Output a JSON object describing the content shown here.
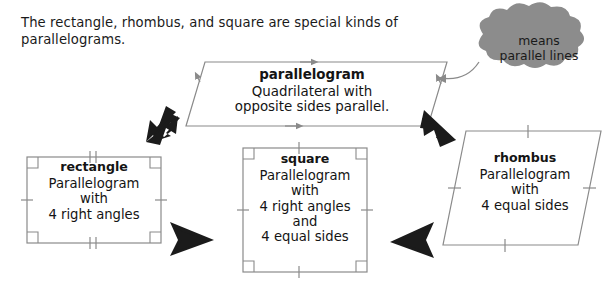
{
  "intro": {
    "text": "The rectangle, rhombus, and square are special kinds of parallelograms."
  },
  "callout": {
    "name": "parallel-lines-callout",
    "line1": "means",
    "line2": "parallel lines",
    "fill_color": "#8c8c8c"
  },
  "shapes": {
    "parallelogram": {
      "title": "parallelogram",
      "lines": [
        "Quadrilateral with",
        "opposite sides parallel."
      ],
      "marks": "single arrowheads on opposite sides"
    },
    "rectangle": {
      "title": "rectangle",
      "lines": [
        "Parallelogram",
        "with",
        "4 right angles"
      ],
      "marks": "right angle corner squares; single ticks on vertical sides; double ticks on horizontal sides"
    },
    "square": {
      "title": "square",
      "lines": [
        "Parallelogram",
        "with",
        "4 right angles",
        "and",
        "4 equal sides"
      ],
      "marks": "right angle corner squares; single tick on all four sides"
    },
    "rhombus": {
      "title": "rhombus",
      "lines": [
        "Parallelogram",
        "with",
        "4 equal sides"
      ],
      "marks": "single tick on all four sides"
    }
  },
  "arrows": [
    {
      "name": "arrow-parallelogram-to-rectangle",
      "direction": "down-left"
    },
    {
      "name": "arrow-parallelogram-to-rhombus",
      "direction": "down-right"
    },
    {
      "name": "arrow-rectangle-to-square",
      "direction": "right"
    },
    {
      "name": "arrow-rhombus-to-square",
      "direction": "left"
    }
  ],
  "colors": {
    "shape_stroke": "#8a8a8a",
    "arrow_fill": "#1b1b1b",
    "text": "#141414",
    "background": "#ffffff"
  }
}
